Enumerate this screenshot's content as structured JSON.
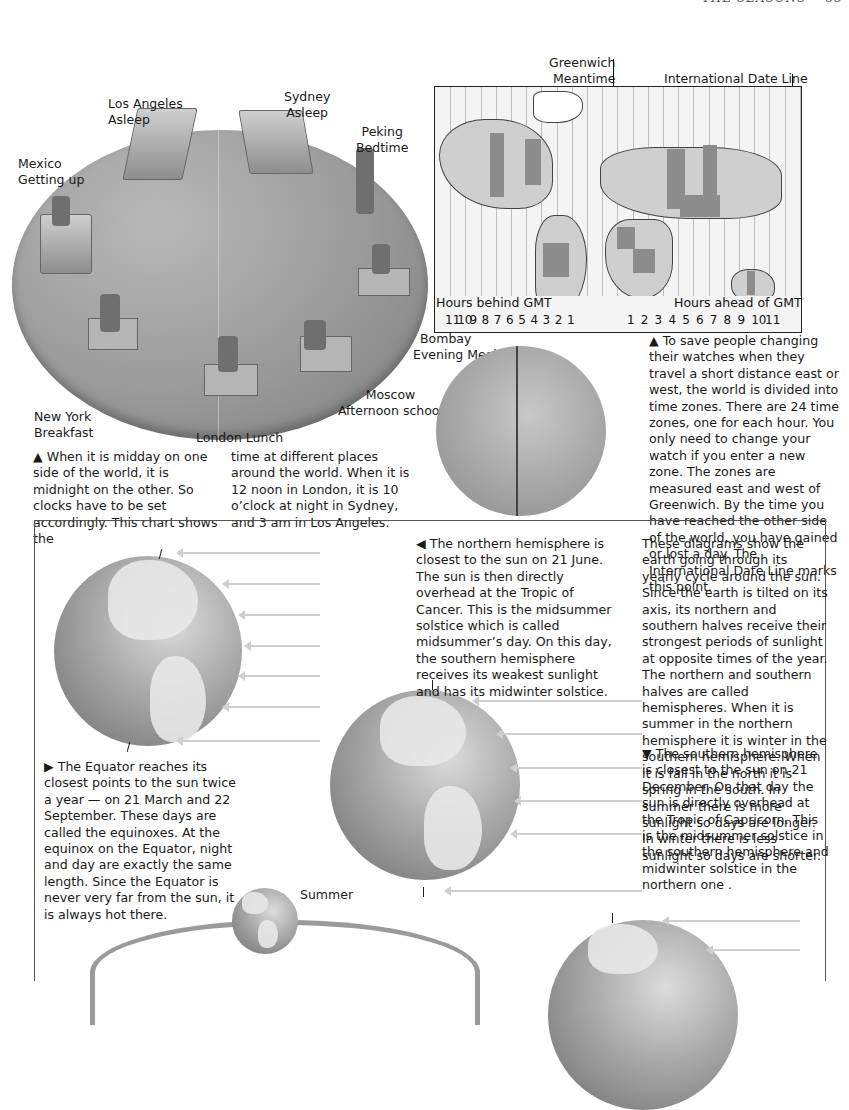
{
  "running_head": {
    "section": "THE SEASONS",
    "page_number": "33"
  },
  "clock_chart": {
    "cities": [
      {
        "city": "Los Angeles",
        "activity": "Asleep"
      },
      {
        "city": "Sydney",
        "activity": "Asleep"
      },
      {
        "city": "Peking",
        "activity": "Bedtime"
      },
      {
        "city": "Mexico",
        "activity": "Getting up"
      },
      {
        "city": "Bombay",
        "activity": "Evening Meal"
      },
      {
        "city": "New York",
        "activity": "Breakfast"
      },
      {
        "city": "Moscow",
        "activity": "Afternoon school"
      },
      {
        "city": "London",
        "activity": "Lunch"
      }
    ],
    "caption_col1": "▲ When it is midday on one side of the world, it is midnight on the other. So clocks have to be set accordingly. This chart shows the",
    "caption_col2": "time at different places around the world. When it is 12 noon in London, it is 10 o’clock at night in Sydney, and 3 am in Los Angeles."
  },
  "time_zone_map": {
    "label_greenwich_1": "Greenwich",
    "label_greenwich_2": "Meantime",
    "label_date_line": "International Date Line",
    "label_behind": "Hours behind GMT",
    "label_ahead": "Hours ahead of GMT",
    "hours_behind": [
      "11",
      "10",
      "9",
      "8",
      "7",
      "6",
      "5",
      "4",
      "3",
      "2",
      "1"
    ],
    "hours_ahead": [
      "1",
      "2",
      "3",
      "4",
      "5",
      "6",
      "7",
      "8",
      "9",
      "10",
      "11"
    ],
    "caption": "▲ To save people changing their watches when they travel a short distance east or west, the world is divided into time zones. There are 24 time zones, one for each hour. You only need to change your watch if you enter a new zone. The zones are measured east and west of Greenwich. By the time you have reached the other side of the world, you have gained or lost a day. The International Date Line marks this point."
  },
  "seasons_panel": {
    "june_caption": "◀ The northern hemisphere is closest to the sun on 21 June. The sun is then directly overhead at the Tropic of Cancer. This is the midsummer solstice which is called midsummer’s day. On this day, the southern hemisphere receives its weakest sunlight and has its midwinter solstice.",
    "intro_text": "These diagrams show the earth going through its yearly cycle around the sun. Since the earth is tilted on its axis, its northern and southern halves receive their strongest periods of sunlight at opposite times of the year. The northern and southern halves are called hemispheres. When it is summer in the northern hemisphere it is winter in the southern hemisphere. When it is fall in the  north it is spring in the south. In summer there is more sunlight so days are longer. In winter there is less sunlight so days are shorter.",
    "december_caption": "▼ The southern hemisphere is closest to the sun on 21 December. On that day the sun is directly overhead at the Tropic of Capricorn. This is the midsummer solstice in the southern hemisphere and midwinter solstice in the northern one .",
    "equinox_caption": "▶ The Equator reaches its closest points to the sun twice a year — on 21 March and 22 September. These days are called the equinoxes. At the equinox on the Equator, night and day are exactly the same length. Since the Equator is never very far from the sun, it is always hot there.",
    "orbit_label": "Summer"
  }
}
